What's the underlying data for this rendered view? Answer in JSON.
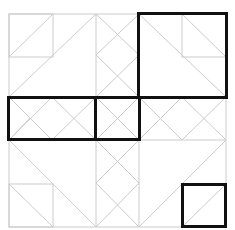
{
  "diagram": {
    "type": "tiling-puzzle",
    "grid_color": "#cccccc",
    "highlight_color": "#111111",
    "grid_lines": {
      "vertical_x": [
        9,
        96,
        139,
        226
      ],
      "horizontal_y": [
        14,
        97,
        140,
        227
      ]
    },
    "highlights": [
      {
        "name": "top-right-square",
        "x": 138,
        "y": 13,
        "w": 89,
        "h": 85
      },
      {
        "name": "middle-left-rectangle",
        "x": 8,
        "y": 97,
        "w": 87,
        "h": 43
      },
      {
        "name": "middle-center-square",
        "x": 95,
        "y": 97,
        "w": 45,
        "h": 43
      },
      {
        "name": "bottom-right-small-square",
        "x": 182,
        "y": 184,
        "w": 44,
        "h": 43
      }
    ]
  }
}
